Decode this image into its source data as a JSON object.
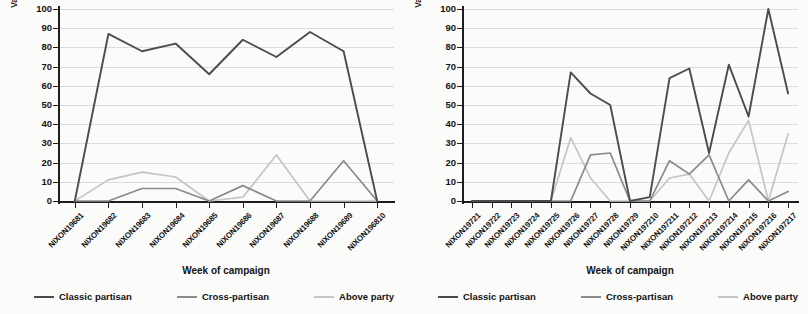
{
  "figure": {
    "background": "#fbfbfa",
    "series_colors": {
      "classic_partisan": "#4c4c4c",
      "cross_partisan": "#8a8a8a",
      "above_party": "#c5c5c5"
    },
    "grid_color": "#d9dce3",
    "axis_color": "#1d1d1d"
  },
  "legend": {
    "items": [
      {
        "label": "Classic partisan",
        "color": "#4c4c4c"
      },
      {
        "label": "Cross-partisan",
        "color": "#8a8a8a"
      },
      {
        "label": "Above party",
        "color": "#c5c5c5"
      }
    ]
  },
  "axes": {
    "ylabel_line1": "Variable use as a percentage of all use",
    "ylabel_line2": "of party rhetoric",
    "xlabel": "Week of campaign",
    "yticks": [
      0,
      10,
      20,
      30,
      40,
      50,
      60,
      70,
      80,
      90,
      100
    ]
  },
  "chart_data": [
    {
      "type": "line",
      "title": "",
      "panel": "left",
      "xlabel": "Week of campaign",
      "ylabel": "Variable use as a percentage of all use of party rhetoric",
      "ylim": [
        0,
        100
      ],
      "grid": true,
      "legend_position": "bottom",
      "categories": [
        "NIXON19681",
        "NIXON19682",
        "NIXON19683",
        "NIXON19684",
        "NIXON19685",
        "NIXON19686",
        "NIXON19687",
        "NIXON19688",
        "NIXON19689",
        "NIXON196810"
      ],
      "series": [
        {
          "name": "Classic partisan",
          "color": "#4c4c4c",
          "values": [
            0,
            87,
            78,
            82,
            66,
            84,
            75,
            88,
            78,
            0
          ]
        },
        {
          "name": "Cross-partisan",
          "color": "#8a8a8a",
          "values": [
            0,
            0,
            6.5,
            6.5,
            0,
            8,
            0,
            0,
            21,
            0
          ]
        },
        {
          "name": "Above party",
          "color": "#c5c5c5",
          "values": [
            0,
            11,
            15,
            12.5,
            0,
            2,
            24,
            0,
            0,
            0
          ]
        }
      ]
    },
    {
      "type": "line",
      "title": "",
      "panel": "right",
      "xlabel": "Week of campaign",
      "ylabel": "Variable use as a percentage of all use of party rhetoric",
      "ylim": [
        0,
        100
      ],
      "grid": true,
      "legend_position": "bottom",
      "categories": [
        "NIXON19721",
        "NIXON19722",
        "NIXON19723",
        "NIXON19724",
        "NIXON19725",
        "NIXON19726",
        "NIXON19727",
        "NIXON19728",
        "NIXON19729",
        "NIXON197210",
        "NIXON197211",
        "NIXON197212",
        "NIXON197213",
        "NIXON197214",
        "NIXON197215",
        "NIXON197216",
        "NIXON197217"
      ],
      "series": [
        {
          "name": "Classic partisan",
          "color": "#4c4c4c",
          "values": [
            0,
            0,
            0,
            0,
            0,
            67,
            56,
            50,
            0,
            2,
            64,
            69,
            25,
            71,
            44,
            100,
            56
          ]
        },
        {
          "name": "Cross-partisan",
          "color": "#8a8a8a",
          "values": [
            0,
            0,
            0,
            0,
            0,
            0,
            24,
            25,
            0,
            0,
            21,
            14,
            24,
            0,
            11,
            0,
            5
          ]
        },
        {
          "name": "Above party",
          "color": "#c5c5c5",
          "values": [
            0,
            0,
            0,
            0,
            0,
            33,
            12,
            0,
            0,
            0,
            12,
            14,
            0,
            25,
            42,
            0,
            35
          ]
        }
      ]
    }
  ]
}
